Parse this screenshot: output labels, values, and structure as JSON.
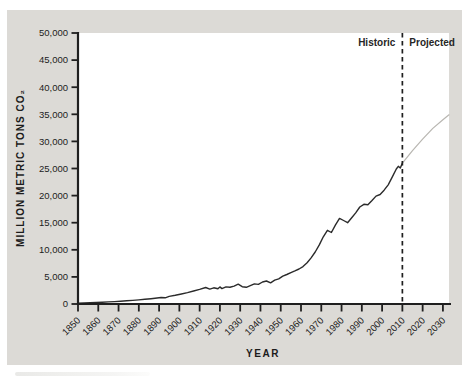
{
  "figure": {
    "panel_background": "#dcdad6",
    "plot_background": "#ffffff"
  },
  "chart_data": {
    "type": "line",
    "title": "",
    "xlabel": "YEAR",
    "ylabel": "MILLION METRIC TONS CO₂",
    "xlim": [
      1850,
      2033
    ],
    "ylim": [
      0,
      50000
    ],
    "grid": false,
    "legend_position": "none",
    "axis_color": "#1f1f1f",
    "tick_label_color": "#1c1c1c",
    "x_ticks": [
      {
        "value": 1850,
        "label": "1850"
      },
      {
        "value": 1860,
        "label": "1860"
      },
      {
        "value": 1870,
        "label": "1870"
      },
      {
        "value": 1880,
        "label": "1880"
      },
      {
        "value": 1890,
        "label": "1890"
      },
      {
        "value": 1900,
        "label": "1900"
      },
      {
        "value": 1910,
        "label": "1910"
      },
      {
        "value": 1920,
        "label": "1920"
      },
      {
        "value": 1930,
        "label": "1930"
      },
      {
        "value": 1940,
        "label": "1940"
      },
      {
        "value": 1950,
        "label": "1950"
      },
      {
        "value": 1960,
        "label": "1960"
      },
      {
        "value": 1970,
        "label": "1970"
      },
      {
        "value": 1980,
        "label": "1980"
      },
      {
        "value": 1990,
        "label": "1990"
      },
      {
        "value": 2000,
        "label": "2000"
      },
      {
        "value": 2010,
        "label": "2010"
      },
      {
        "value": 2020,
        "label": "2020"
      },
      {
        "value": 2030,
        "label": "2030"
      }
    ],
    "y_ticks": [
      {
        "value": 0,
        "label": "0"
      },
      {
        "value": 5000,
        "label": "5,000"
      },
      {
        "value": 10000,
        "label": "10,000"
      },
      {
        "value": 15000,
        "label": "15,000"
      },
      {
        "value": 20000,
        "label": "20,000"
      },
      {
        "value": 25000,
        "label": "25,000"
      },
      {
        "value": 30000,
        "label": "30,000"
      },
      {
        "value": 35000,
        "label": "35,000"
      },
      {
        "value": 40000,
        "label": "40,000"
      },
      {
        "value": 45000,
        "label": "45,000"
      },
      {
        "value": 50000,
        "label": "50,000"
      }
    ],
    "divider": {
      "x": 2010,
      "style": "dashed",
      "color": "#1f1f1f"
    },
    "annotations": {
      "historic_label": "Historic",
      "projected_label": "Projected"
    },
    "series": [
      {
        "name": "Historic",
        "color": "#2b2b2b",
        "width": 1.4,
        "points": [
          [
            1850,
            150
          ],
          [
            1853,
            200
          ],
          [
            1856,
            240
          ],
          [
            1859,
            280
          ],
          [
            1862,
            330
          ],
          [
            1865,
            390
          ],
          [
            1868,
            450
          ],
          [
            1871,
            520
          ],
          [
            1874,
            590
          ],
          [
            1877,
            670
          ],
          [
            1880,
            760
          ],
          [
            1883,
            860
          ],
          [
            1886,
            970
          ],
          [
            1889,
            1100
          ],
          [
            1891,
            1200
          ],
          [
            1893,
            1150
          ],
          [
            1895,
            1400
          ],
          [
            1898,
            1600
          ],
          [
            1901,
            1850
          ],
          [
            1904,
            2100
          ],
          [
            1907,
            2400
          ],
          [
            1910,
            2700
          ],
          [
            1913,
            3050
          ],
          [
            1915,
            2750
          ],
          [
            1917,
            2980
          ],
          [
            1919,
            2800
          ],
          [
            1920,
            3150
          ],
          [
            1921,
            2850
          ],
          [
            1923,
            3150
          ],
          [
            1925,
            3100
          ],
          [
            1927,
            3300
          ],
          [
            1929,
            3650
          ],
          [
            1931,
            3200
          ],
          [
            1933,
            3080
          ],
          [
            1935,
            3400
          ],
          [
            1937,
            3700
          ],
          [
            1939,
            3620
          ],
          [
            1941,
            4050
          ],
          [
            1943,
            4250
          ],
          [
            1945,
            3900
          ],
          [
            1947,
            4400
          ],
          [
            1949,
            4650
          ],
          [
            1951,
            5150
          ],
          [
            1953,
            5450
          ],
          [
            1955,
            5800
          ],
          [
            1957,
            6100
          ],
          [
            1959,
            6450
          ],
          [
            1961,
            6900
          ],
          [
            1963,
            7600
          ],
          [
            1965,
            8500
          ],
          [
            1967,
            9600
          ],
          [
            1969,
            10900
          ],
          [
            1971,
            12400
          ],
          [
            1973,
            13600
          ],
          [
            1975,
            13200
          ],
          [
            1977,
            14600
          ],
          [
            1979,
            15800
          ],
          [
            1981,
            15400
          ],
          [
            1983,
            15000
          ],
          [
            1985,
            15900
          ],
          [
            1987,
            16800
          ],
          [
            1989,
            17900
          ],
          [
            1991,
            18400
          ],
          [
            1993,
            18300
          ],
          [
            1995,
            19100
          ],
          [
            1997,
            19900
          ],
          [
            1999,
            20200
          ],
          [
            2001,
            21000
          ],
          [
            2003,
            22000
          ],
          [
            2005,
            23400
          ],
          [
            2007,
            24900
          ],
          [
            2008,
            25400
          ],
          [
            2009,
            25100
          ],
          [
            2010,
            26000
          ]
        ]
      },
      {
        "name": "Projected",
        "color": "#b8b6b1",
        "width": 1.2,
        "points": [
          [
            2010,
            26000
          ],
          [
            2015,
            28300
          ],
          [
            2020,
            30400
          ],
          [
            2025,
            32400
          ],
          [
            2030,
            34000
          ],
          [
            2033,
            34900
          ]
        ]
      }
    ]
  }
}
